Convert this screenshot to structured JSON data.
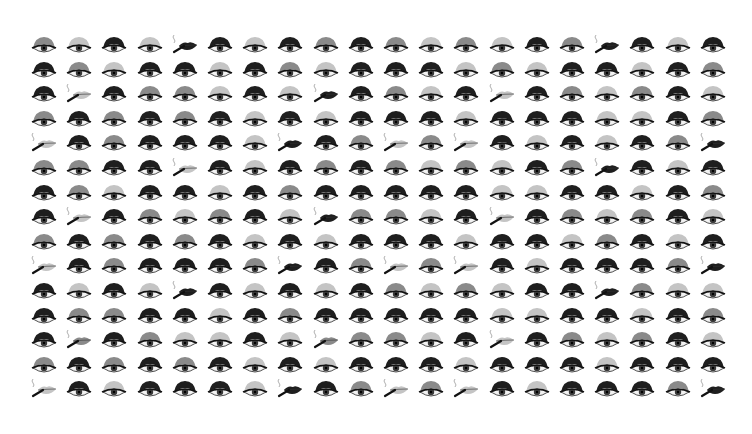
{
  "artwork": {
    "rows": 15,
    "columns": 20,
    "origin": {
      "x": 44,
      "y": 46
    },
    "spacing": {
      "x": 35.2,
      "y": 24.6
    },
    "legend": {
      "L": {
        "motif": "eye",
        "shade": "light"
      },
      "M": {
        "motif": "eye",
        "shade": "medium"
      },
      "D": {
        "motif": "eye",
        "shade": "dark"
      },
      "PL": {
        "motif": "smoking-lips",
        "shade": "light"
      },
      "PM": {
        "motif": "smoking-lips",
        "shade": "medium"
      },
      "PD": {
        "motif": "smoking-lips",
        "shade": "dark"
      }
    },
    "colors": {
      "background": "#ffffff",
      "light": "#c4c4c4",
      "medium": "#8a8a8a",
      "dark": "#1e1e1e",
      "eye_white": "#f2f2f2",
      "iris": "#3a3a3a",
      "smoke": "#9a9a9a",
      "cigarette": "#111111"
    },
    "grid": [
      [
        "M",
        "L",
        "D",
        "L",
        "PD",
        "D",
        "L",
        "D",
        "M",
        "D",
        "M",
        "L",
        "M",
        "L",
        "D",
        "M",
        "PD",
        "D",
        "L",
        "D"
      ],
      [
        "D",
        "M",
        "L",
        "D",
        "D",
        "L",
        "D",
        "M",
        "L",
        "D",
        "D",
        "D",
        "L",
        "M",
        "L",
        "D",
        "D",
        "L",
        "D",
        "M"
      ],
      [
        "D",
        "PL",
        "D",
        "M",
        "M",
        "L",
        "D",
        "L",
        "PD",
        "D",
        "M",
        "L",
        "D",
        "PL",
        "D",
        "M",
        "L",
        "M",
        "D",
        "L"
      ],
      [
        "M",
        "D",
        "M",
        "D",
        "M",
        "D",
        "L",
        "D",
        "L",
        "D",
        "D",
        "D",
        "L",
        "D",
        "D",
        "D",
        "L",
        "L",
        "D",
        "M"
      ],
      [
        "PL",
        "D",
        "M",
        "D",
        "D",
        "D",
        "L",
        "PD",
        "D",
        "M",
        "PL",
        "M",
        "PL",
        "D",
        "L",
        "D",
        "L",
        "D",
        "M",
        "PD"
      ],
      [
        "M",
        "M",
        "D",
        "D",
        "PL",
        "D",
        "L",
        "D",
        "M",
        "D",
        "M",
        "L",
        "M",
        "L",
        "D",
        "M",
        "PD",
        "D",
        "L",
        "D"
      ],
      [
        "D",
        "M",
        "L",
        "D",
        "D",
        "L",
        "D",
        "M",
        "D",
        "D",
        "D",
        "D",
        "D",
        "L",
        "L",
        "D",
        "D",
        "L",
        "D",
        "M"
      ],
      [
        "D",
        "PL",
        "D",
        "M",
        "L",
        "M",
        "D",
        "L",
        "PD",
        "M",
        "M",
        "L",
        "D",
        "PL",
        "D",
        "M",
        "L",
        "M",
        "D",
        "L"
      ],
      [
        "M",
        "D",
        "M",
        "D",
        "M",
        "D",
        "L",
        "D",
        "L",
        "D",
        "D",
        "D",
        "L",
        "D",
        "D",
        "L",
        "M",
        "D",
        "L",
        "D"
      ],
      [
        "PL",
        "D",
        "M",
        "D",
        "D",
        "D",
        "M",
        "PD",
        "D",
        "M",
        "PL",
        "M",
        "PL",
        "D",
        "L",
        "D",
        "D",
        "D",
        "M",
        "PD"
      ],
      [
        "D",
        "L",
        "D",
        "L",
        "PD",
        "D",
        "L",
        "D",
        "L",
        "D",
        "M",
        "L",
        "M",
        "L",
        "D",
        "D",
        "PD",
        "M",
        "L",
        "L"
      ],
      [
        "D",
        "M",
        "M",
        "D",
        "D",
        "L",
        "D",
        "M",
        "D",
        "D",
        "D",
        "D",
        "D",
        "L",
        "L",
        "D",
        "D",
        "L",
        "D",
        "M"
      ],
      [
        "D",
        "PM",
        "D",
        "M",
        "L",
        "L",
        "D",
        "L",
        "PM",
        "M",
        "M",
        "L",
        "D",
        "PL",
        "D",
        "M",
        "L",
        "M",
        "D",
        "L"
      ],
      [
        "M",
        "D",
        "M",
        "D",
        "M",
        "D",
        "L",
        "D",
        "L",
        "D",
        "D",
        "D",
        "L",
        "D",
        "D",
        "D",
        "L",
        "D",
        "D",
        "D"
      ],
      [
        "PL",
        "D",
        "L",
        "D",
        "D",
        "D",
        "L",
        "PD",
        "D",
        "M",
        "PL",
        "M",
        "PL",
        "D",
        "L",
        "D",
        "D",
        "D",
        "M",
        "PD"
      ]
    ]
  }
}
